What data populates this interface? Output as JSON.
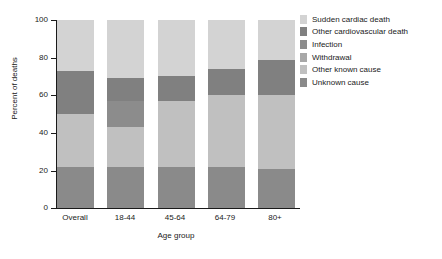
{
  "chart_data": {
    "type": "bar",
    "title": "",
    "xlabel": "Age group",
    "ylabel": "Percent of deaths",
    "categories": [
      "Overall",
      "18-44",
      "45-64",
      "64-79",
      "80+"
    ],
    "ylim": [
      0,
      100
    ],
    "yticks": [
      0,
      20,
      40,
      60,
      80,
      100
    ],
    "grid": false,
    "stacked": true,
    "legend_position": "right",
    "series": [
      {
        "name": "Sudden cardiac death",
        "color": "#d3d3d3",
        "values": [
          27,
          31,
          30,
          26,
          21
        ]
      },
      {
        "name": "Other cardiovascular death",
        "color": "#808080",
        "values": [
          23,
          12,
          13,
          14,
          19
        ]
      },
      {
        "name": "Infection",
        "color": "#8c8c8c",
        "values": [
          0,
          14,
          0,
          0,
          0
        ]
      },
      {
        "name": "Withdrawal",
        "color": "#a8a8a8",
        "values": [
          0,
          0,
          0,
          0,
          0
        ]
      },
      {
        "name": "Other known cause",
        "color": "#c0c0c0",
        "values": [
          28,
          21,
          35,
          38,
          39
        ]
      },
      {
        "name": "Unknown cause",
        "color": "#8a8a8a",
        "values": [
          22,
          22,
          22,
          22,
          21
        ]
      }
    ]
  },
  "legend": {
    "items": [
      {
        "label": "Sudden cardiac death",
        "color": "#d3d3d3"
      },
      {
        "label": "Other cardiovascular death",
        "color": "#808080"
      },
      {
        "label": "Infection",
        "color": "#8c8c8c"
      },
      {
        "label": "Withdrawal",
        "color": "#a8a8a8"
      },
      {
        "label": "Other known cause",
        "color": "#c0c0c0"
      },
      {
        "label": "Unknown cause",
        "color": "#8a8a8a"
      }
    ]
  },
  "axis": {
    "y_tick_labels": [
      "100",
      "80",
      "60",
      "40",
      "20",
      "0"
    ],
    "x_tick_labels": [
      "Overall",
      "18-44",
      "45-64",
      "64-79",
      "80+"
    ]
  }
}
